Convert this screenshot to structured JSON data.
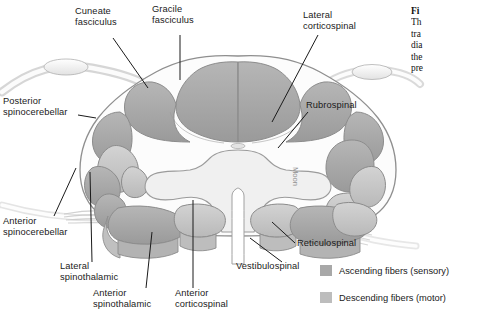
{
  "figure": {
    "signature": "Moon"
  },
  "labels": [
    {
      "id": "cuneate-fasciculus",
      "text": "Cuneate\nfasciculus"
    },
    {
      "id": "gracile-fasciculus",
      "text": "Gracile\nfasciculus"
    },
    {
      "id": "lateral-corticospinal",
      "text": "Lateral\ncorticospinal"
    },
    {
      "id": "rubrospinal",
      "text": "Rubrospinal"
    },
    {
      "id": "posterior-spinocerebellar",
      "text": "Posterior\nspinocerebellar"
    },
    {
      "id": "anterior-spinocerebellar",
      "text": "Anterior\nspinocerebellar"
    },
    {
      "id": "lateral-spinothalamic",
      "text": "Lateral\nspinothalamic"
    },
    {
      "id": "anterior-spinothalamic",
      "text": "Anterior\nspinothalamic"
    },
    {
      "id": "anterior-corticospinal",
      "text": "Anterior\ncorticospinal"
    },
    {
      "id": "vestibulospinal",
      "text": "Vestibulospinal"
    },
    {
      "id": "reticulospinal",
      "text": "Reticulospinal"
    }
  ],
  "legend": {
    "items": [
      {
        "id": "ascending",
        "label": "Ascending fibers (sensory)",
        "color": "#a8a8a8"
      },
      {
        "id": "descending",
        "label": "Descending fibers (motor)",
        "color": "#bdbdbd"
      }
    ]
  },
  "caption": {
    "line1": "Fi",
    "line2": "Th",
    "line3": "tra",
    "line4": "dia",
    "line5": "the",
    "line6": "pre"
  },
  "colors": {
    "background": "#ffffff",
    "outline": "#8c8c8c",
    "cord_fill": "#fbfbfb",
    "gray_matter": "#efefef",
    "tract_dark": "#a8a8a8",
    "tract_light": "#c6c6c6",
    "leader": "#1a1a1a",
    "text": "#1a1a1a"
  }
}
